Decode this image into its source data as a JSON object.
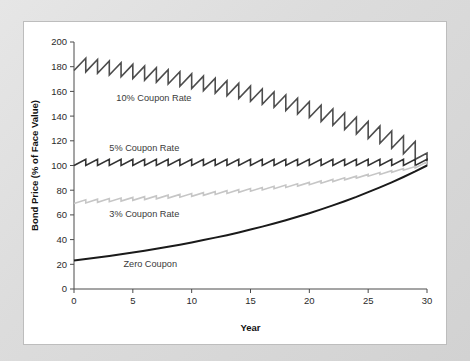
{
  "figure": {
    "background_color": "#dcdcdc",
    "panel_color": "#ffffff",
    "panel_border_color": "#bdbdbd"
  },
  "chart_data": {
    "type": "line",
    "title": "",
    "subtitle": "",
    "xlabel": "Year",
    "ylabel": "Bond Price (% of Face Value)",
    "xlim": [
      0,
      30
    ],
    "ylim": [
      0,
      200
    ],
    "xticks": [
      0,
      5,
      10,
      15,
      20,
      25,
      30
    ],
    "xtick_labels": [
      "0",
      "5",
      "10",
      "15",
      "20",
      "25",
      "30"
    ],
    "yticks": [
      0,
      20,
      40,
      60,
      80,
      100,
      120,
      140,
      160,
      180,
      200
    ],
    "ytick_labels": [
      "0",
      "20",
      "40",
      "60",
      "80",
      "100",
      "120",
      "140",
      "160",
      "180",
      "200"
    ],
    "grid": false,
    "legend_position": "inline-annotations",
    "annotations": [
      {
        "text": "10% Coupon Rate",
        "x": 3.6,
        "y": 152,
        "color": "#3a3a3a"
      },
      {
        "text": "5% Coupon Rate",
        "x": 3.0,
        "y": 112,
        "color": "#3a3a3a"
      },
      {
        "text": "3% Coupon Rate",
        "x": 3.0,
        "y": 58,
        "color": "#3a3a3a"
      },
      {
        "text": "Zero Coupon",
        "x": 4.2,
        "y": 18,
        "color": "#3a3a3a"
      }
    ],
    "series": [
      {
        "name": "10% Coupon Rate",
        "coupon_rate": 10,
        "color": "#4d4d4d",
        "line_width": 1.6,
        "sawtooth": true,
        "x": [
          0,
          1,
          2,
          3,
          4,
          5,
          6,
          7,
          8,
          9,
          10,
          11,
          12,
          13,
          14,
          15,
          16,
          17,
          18,
          19,
          20,
          21,
          22,
          23,
          24,
          25,
          26,
          27,
          28,
          29,
          30
        ],
        "values": [
          176.9,
          175.8,
          174.6,
          173.3,
          171.9,
          170.5,
          169.1,
          167.5,
          165.9,
          164.2,
          162.4,
          160.6,
          158.6,
          156.5,
          154.3,
          152.0,
          149.6,
          147.1,
          144.5,
          141.7,
          138.8,
          135.7,
          132.5,
          129.1,
          125.6,
          121.9,
          118.0,
          113.9,
          109.5,
          105.0,
          100.0
        ],
        "peak_values": [
          186.9,
          185.8,
          184.6,
          183.3,
          181.9,
          180.5,
          179.1,
          177.5,
          175.9,
          174.2,
          172.4,
          170.6,
          168.6,
          166.5,
          164.3,
          162.0,
          159.6,
          157.1,
          154.5,
          151.7,
          148.8,
          145.7,
          142.5,
          139.1,
          135.6,
          131.9,
          128.0,
          123.9,
          119.5,
          110.0
        ]
      },
      {
        "name": "5% Coupon Rate",
        "coupon_rate": 5,
        "color": "#333333",
        "line_width": 1.6,
        "sawtooth": true,
        "x": [
          0,
          1,
          2,
          3,
          4,
          5,
          6,
          7,
          8,
          9,
          10,
          11,
          12,
          13,
          14,
          15,
          16,
          17,
          18,
          19,
          20,
          21,
          22,
          23,
          24,
          25,
          26,
          27,
          28,
          29,
          30
        ],
        "values": [
          100,
          100,
          100,
          100,
          100,
          100,
          100,
          100,
          100,
          100,
          100,
          100,
          100,
          100,
          100,
          100,
          100,
          100,
          100,
          100,
          100,
          100,
          100,
          100,
          100,
          100,
          100,
          100,
          100,
          100,
          100
        ],
        "peak_values": [
          105,
          105,
          105,
          105,
          105,
          105,
          105,
          105,
          105,
          105,
          105,
          105,
          105,
          105,
          105,
          105,
          105,
          105,
          105,
          105,
          105,
          105,
          105,
          105,
          105,
          105,
          105,
          105,
          105,
          105
        ]
      },
      {
        "name": "3% Coupon Rate",
        "coupon_rate": 3,
        "color": "#c6c6c6",
        "line_width": 1.6,
        "sawtooth": true,
        "x": [
          0,
          1,
          2,
          3,
          4,
          5,
          6,
          7,
          8,
          9,
          10,
          11,
          12,
          13,
          14,
          15,
          16,
          17,
          18,
          19,
          20,
          21,
          22,
          23,
          24,
          25,
          26,
          27,
          28,
          29,
          30
        ],
        "values": [
          69.2,
          69.7,
          70.2,
          70.7,
          71.2,
          71.8,
          72.4,
          73.0,
          73.6,
          74.3,
          75.0,
          75.8,
          76.6,
          77.4,
          78.3,
          79.2,
          80.2,
          81.2,
          82.2,
          83.3,
          84.5,
          85.7,
          87.0,
          88.4,
          89.8,
          91.3,
          92.8,
          94.5,
          96.2,
          98.1,
          100.0
        ],
        "peak_values": [
          72.2,
          72.7,
          73.2,
          73.7,
          74.2,
          74.8,
          75.4,
          76.0,
          76.6,
          77.3,
          78.0,
          78.8,
          79.6,
          80.4,
          81.3,
          82.2,
          83.2,
          84.2,
          85.2,
          86.3,
          87.5,
          88.7,
          90.0,
          91.4,
          92.8,
          94.3,
          95.8,
          97.5,
          99.2,
          103.0
        ]
      },
      {
        "name": "Zero Coupon",
        "coupon_rate": 0,
        "color": "#1a1a1a",
        "line_width": 2.0,
        "sawtooth": false,
        "x": [
          0,
          1,
          2,
          3,
          4,
          5,
          6,
          7,
          8,
          9,
          10,
          11,
          12,
          13,
          14,
          15,
          16,
          17,
          18,
          19,
          20,
          21,
          22,
          23,
          24,
          25,
          26,
          27,
          28,
          29,
          30
        ],
        "values": [
          23.1,
          24.3,
          25.5,
          26.8,
          28.1,
          29.5,
          31.0,
          32.6,
          34.2,
          35.9,
          37.7,
          39.6,
          41.6,
          43.6,
          45.8,
          48.1,
          50.5,
          53.0,
          55.7,
          58.5,
          61.4,
          64.5,
          67.7,
          71.1,
          74.6,
          78.4,
          82.3,
          86.4,
          90.7,
          95.2,
          100.0
        ]
      }
    ]
  }
}
